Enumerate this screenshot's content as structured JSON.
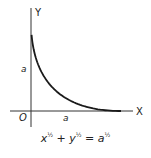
{
  "diagram": {
    "axis_labels": {
      "x": "X",
      "y": "Y",
      "origin": "O"
    },
    "tick_labels": {
      "x_intercept": "a",
      "y_intercept": "a"
    },
    "equation": {
      "text": "x^(1/2) + y^(1/2) = a^(1/2)",
      "x_var": "x",
      "y_var": "y",
      "a_var": "a",
      "exponent": "½",
      "plus": "+",
      "equals": "="
    },
    "curve": "astroid-like parabola segment x^½ + y^½ = a^½ in first quadrant",
    "colors": {
      "stroke": "#1a1a1a",
      "axis": "#333333",
      "background": "#ffffff"
    }
  }
}
